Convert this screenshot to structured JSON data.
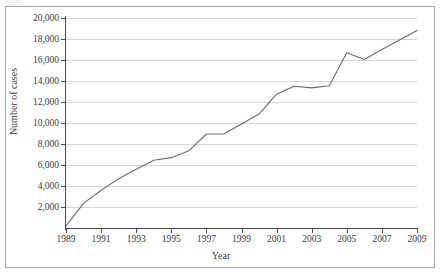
{
  "figure": {
    "background_color": "#ffffff",
    "frame_color": "#a9a9a9",
    "axis_color": "#4c4c4c",
    "grid_color": "#d7d7d7",
    "series_color": "#6b6b6b"
  },
  "chart_data": {
    "type": "line",
    "title": "",
    "xlabel": "Year",
    "ylabel": "Number of cases",
    "xlim": [
      1989,
      2009
    ],
    "ylim": [
      0,
      20000
    ],
    "grid": "horizontal",
    "legend": "none",
    "x_tick_labels": [
      "1989",
      "1991",
      "1993",
      "1995",
      "1997",
      "1999",
      "2001",
      "2003",
      "2005",
      "2007",
      "2009"
    ],
    "x_tick_values": [
      1989,
      1991,
      1993,
      1995,
      1997,
      1999,
      2001,
      2003,
      2005,
      2007,
      2009
    ],
    "y_tick_labels": [
      "2,000",
      "4,000",
      "6,000",
      "8,000",
      "10,000",
      "12,000",
      "14,000",
      "16,000",
      "18,000",
      "20,000"
    ],
    "y_tick_values": [
      2000,
      4000,
      6000,
      8000,
      10000,
      12000,
      14000,
      16000,
      18000,
      20000
    ],
    "x": [
      1989,
      1990,
      1991,
      1992,
      1993,
      1994,
      1995,
      1996,
      1997,
      1998,
      1999,
      2000,
      2001,
      2002,
      2003,
      2004,
      2005,
      2006,
      2007,
      2008,
      2009
    ],
    "series": [
      {
        "name": "Number of cases",
        "values": [
          200,
          2350,
          3600,
          4700,
          5600,
          6450,
          6700,
          7350,
          8950,
          8950,
          9900,
          10850,
          12750,
          13500,
          13350,
          13550,
          16700,
          16050,
          17000,
          17900,
          18800
        ]
      }
    ]
  }
}
